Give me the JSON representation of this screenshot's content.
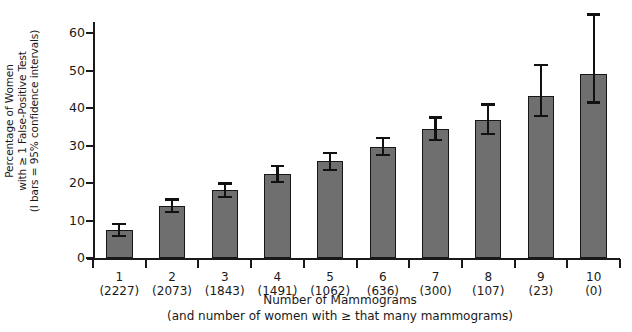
{
  "chart_data": {
    "type": "bar",
    "title": "",
    "xlabel": "Number of Mammograms",
    "xlabel_line2": "(and number of women with ≥ that many mammograms)",
    "ylabel_line1": "Percentage of Women",
    "ylabel_line2": "with ≥ 1 False-Positive Test",
    "ylabel_line3": "(I bars = 95% confidence intervals)",
    "categories": [
      "1",
      "2",
      "3",
      "4",
      "5",
      "6",
      "7",
      "8",
      "9",
      "10"
    ],
    "category_counts": [
      "(2227)",
      "(2073)",
      "(1843)",
      "(1491)",
      "(1062)",
      "(636)",
      "(300)",
      "(107)",
      "(23)",
      "(0)"
    ],
    "values": [
      7.4,
      13.9,
      18.1,
      22.3,
      25.8,
      29.7,
      34.4,
      36.8,
      43.3,
      49.0
    ],
    "ci_lower": [
      5.9,
      12.3,
      16.3,
      20.2,
      23.5,
      27.6,
      31.5,
      33.0,
      37.8,
      41.5
    ],
    "ci_upper": [
      9.0,
      15.6,
      19.9,
      24.6,
      28.1,
      32.0,
      37.5,
      41.0,
      51.5,
      65.0
    ],
    "ylim": [
      0,
      63
    ],
    "yticks": [
      0,
      10,
      20,
      30,
      40,
      50,
      60
    ],
    "ytick_labels": [
      "0",
      "10",
      "20",
      "30",
      "40",
      "50",
      "60"
    ],
    "grid": false,
    "legend": "none",
    "bar_color": "#6f6f6f",
    "bar_edge_color": "#171717",
    "error_bar_color": "#111111",
    "axis_color": "#1a1a1a",
    "background_color": "#ffffff"
  }
}
